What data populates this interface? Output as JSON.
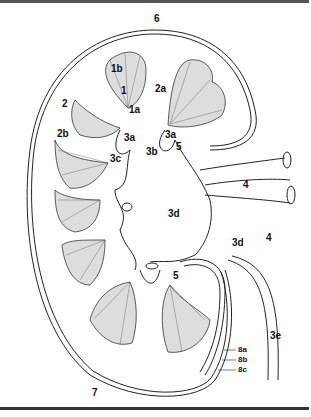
{
  "diagram": {
    "type": "anatomical-illustration",
    "labels": [
      {
        "id": "l6",
        "text": "6",
        "x": 154,
        "y": 14
      },
      {
        "id": "l1b",
        "text": "1b",
        "x": 111,
        "y": 64
      },
      {
        "id": "l1",
        "text": "1",
        "x": 121,
        "y": 86
      },
      {
        "id": "l2a",
        "text": "2a",
        "x": 155,
        "y": 84
      },
      {
        "id": "l2",
        "text": "2",
        "x": 62,
        "y": 99
      },
      {
        "id": "l1a",
        "text": "1a",
        "x": 129,
        "y": 105
      },
      {
        "id": "l2b",
        "text": "2b",
        "x": 57,
        "y": 129
      },
      {
        "id": "l3a_left",
        "text": "3a",
        "x": 124,
        "y": 133
      },
      {
        "id": "l3a_right",
        "text": "3a",
        "x": 165,
        "y": 130
      },
      {
        "id": "l3b",
        "text": "3b",
        "x": 146,
        "y": 147
      },
      {
        "id": "l5_top",
        "text": "5",
        "x": 176,
        "y": 142
      },
      {
        "id": "l3c",
        "text": "3c",
        "x": 110,
        "y": 154
      },
      {
        "id": "l4_top",
        "text": "4",
        "x": 243,
        "y": 180
      },
      {
        "id": "l3d_center",
        "text": "3d",
        "x": 168,
        "y": 209
      },
      {
        "id": "l3d_right",
        "text": "3d",
        "x": 232,
        "y": 238
      },
      {
        "id": "l4_bottom",
        "text": "4",
        "x": 266,
        "y": 233
      },
      {
        "id": "l5_bottom",
        "text": "5",
        "x": 173,
        "y": 271
      },
      {
        "id": "l3e",
        "text": "3e",
        "x": 270,
        "y": 331
      },
      {
        "id": "l8a",
        "text": "8a",
        "x": 238,
        "y": 346
      },
      {
        "id": "l8b",
        "text": "8b",
        "x": 238,
        "y": 356
      },
      {
        "id": "l8c",
        "text": "8c",
        "x": 238,
        "y": 366
      },
      {
        "id": "l7",
        "text": "7",
        "x": 92,
        "y": 388
      }
    ]
  }
}
